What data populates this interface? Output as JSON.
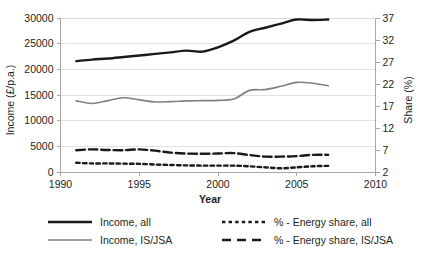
{
  "chart_data": {
    "type": "line",
    "title": "",
    "xlabel": "Year",
    "ylabel": "Income (£/p.a.)",
    "y2label": "Share (%)",
    "xlim": [
      1990,
      2010
    ],
    "xticks": [
      1990,
      1995,
      2000,
      2005,
      2010
    ],
    "xtick_labels": [
      "1990",
      "1995",
      "2000",
      "2005",
      "2010"
    ],
    "ylim": [
      0,
      30000
    ],
    "yticks": [
      0,
      5000,
      10000,
      15000,
      20000,
      25000,
      30000
    ],
    "ytick_labels": [
      "0",
      "5000",
      "10000",
      "15000",
      "20000",
      "25000",
      "30000"
    ],
    "y2lim": [
      2,
      37
    ],
    "y2ticks": [
      2,
      7,
      12,
      17,
      22,
      27,
      32,
      37
    ],
    "y2tick_labels": [
      "2",
      "7",
      "12",
      "17",
      "22",
      "27",
      "32",
      "37"
    ],
    "grid": true,
    "legend_position": "bottom",
    "x": [
      1991,
      1992,
      1993,
      1994,
      1995,
      1996,
      1997,
      1998,
      1999,
      2000,
      2001,
      2002,
      2003,
      2004,
      2005,
      2006,
      2007
    ],
    "series": [
      {
        "name": "Income, all",
        "axis": "left",
        "color": "#1a1a1a",
        "style": "solid",
        "width": 2.4,
        "values": [
          21600,
          21900,
          22100,
          22400,
          22700,
          23000,
          23300,
          23650,
          23450,
          24300,
          25600,
          27300,
          28100,
          28900,
          29700,
          29600,
          29700
        ]
      },
      {
        "name": "Income, IS/JSA",
        "axis": "left",
        "color": "#808080",
        "style": "solid",
        "width": 1.6,
        "values": [
          13850,
          13350,
          13900,
          14450,
          14050,
          13650,
          13700,
          13850,
          13900,
          13950,
          14200,
          15900,
          16050,
          16700,
          17450,
          17300,
          16800
        ]
      },
      {
        "name": "% - Energy share, all",
        "axis": "right",
        "color": "#1a1a1a",
        "style": "dotted",
        "width": 2.4,
        "values": [
          4.1,
          3.95,
          3.95,
          3.9,
          3.85,
          3.7,
          3.6,
          3.5,
          3.45,
          3.45,
          3.45,
          3.3,
          3.05,
          2.85,
          3.05,
          3.3,
          3.4
        ]
      },
      {
        "name": "% - Energy share, IS/JSA",
        "axis": "right",
        "color": "#1a1a1a",
        "style": "dashed",
        "width": 2.4,
        "values": [
          6.95,
          7.15,
          7.0,
          6.95,
          7.15,
          6.85,
          6.4,
          6.2,
          6.15,
          6.2,
          6.3,
          5.85,
          5.5,
          5.5,
          5.6,
          5.9,
          5.9
        ]
      }
    ]
  },
  "legend": {
    "entries": [
      {
        "label": "Income, all",
        "swatch": "solid-black"
      },
      {
        "label": "% - Energy share, all",
        "swatch": "dotted-black"
      },
      {
        "label": "Income,  IS/JSA",
        "swatch": "solid-gray"
      },
      {
        "label": "% - Energy share, IS/JSA",
        "swatch": "dashed-black"
      }
    ]
  }
}
